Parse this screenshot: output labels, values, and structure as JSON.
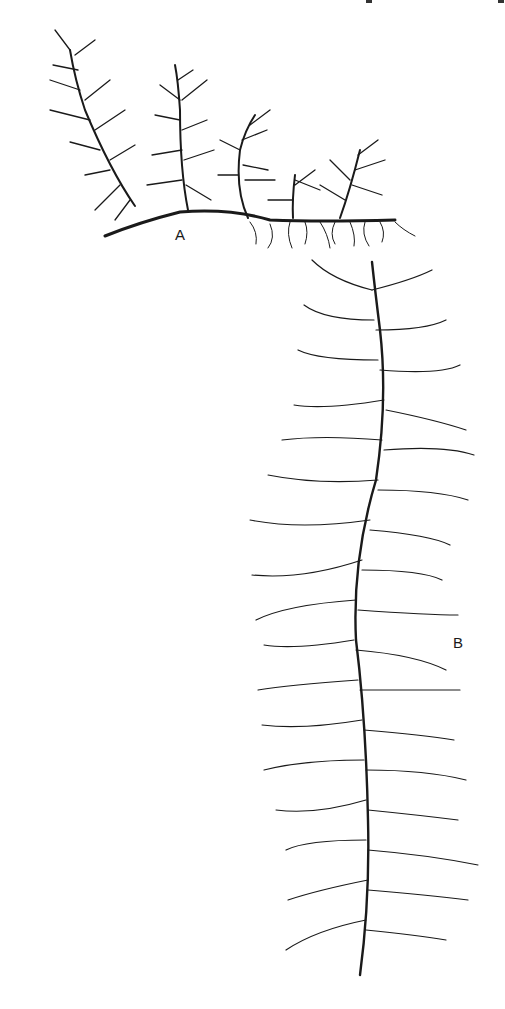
{
  "figure": {
    "panels": [
      {
        "label": "A",
        "description": "creeping plant with fronds and roots"
      },
      {
        "label": "B",
        "description": "tall feathery stem with whorled filiform leaves"
      }
    ],
    "colors": {
      "ink": "#1a1a1a",
      "background": "#ffffff"
    }
  }
}
